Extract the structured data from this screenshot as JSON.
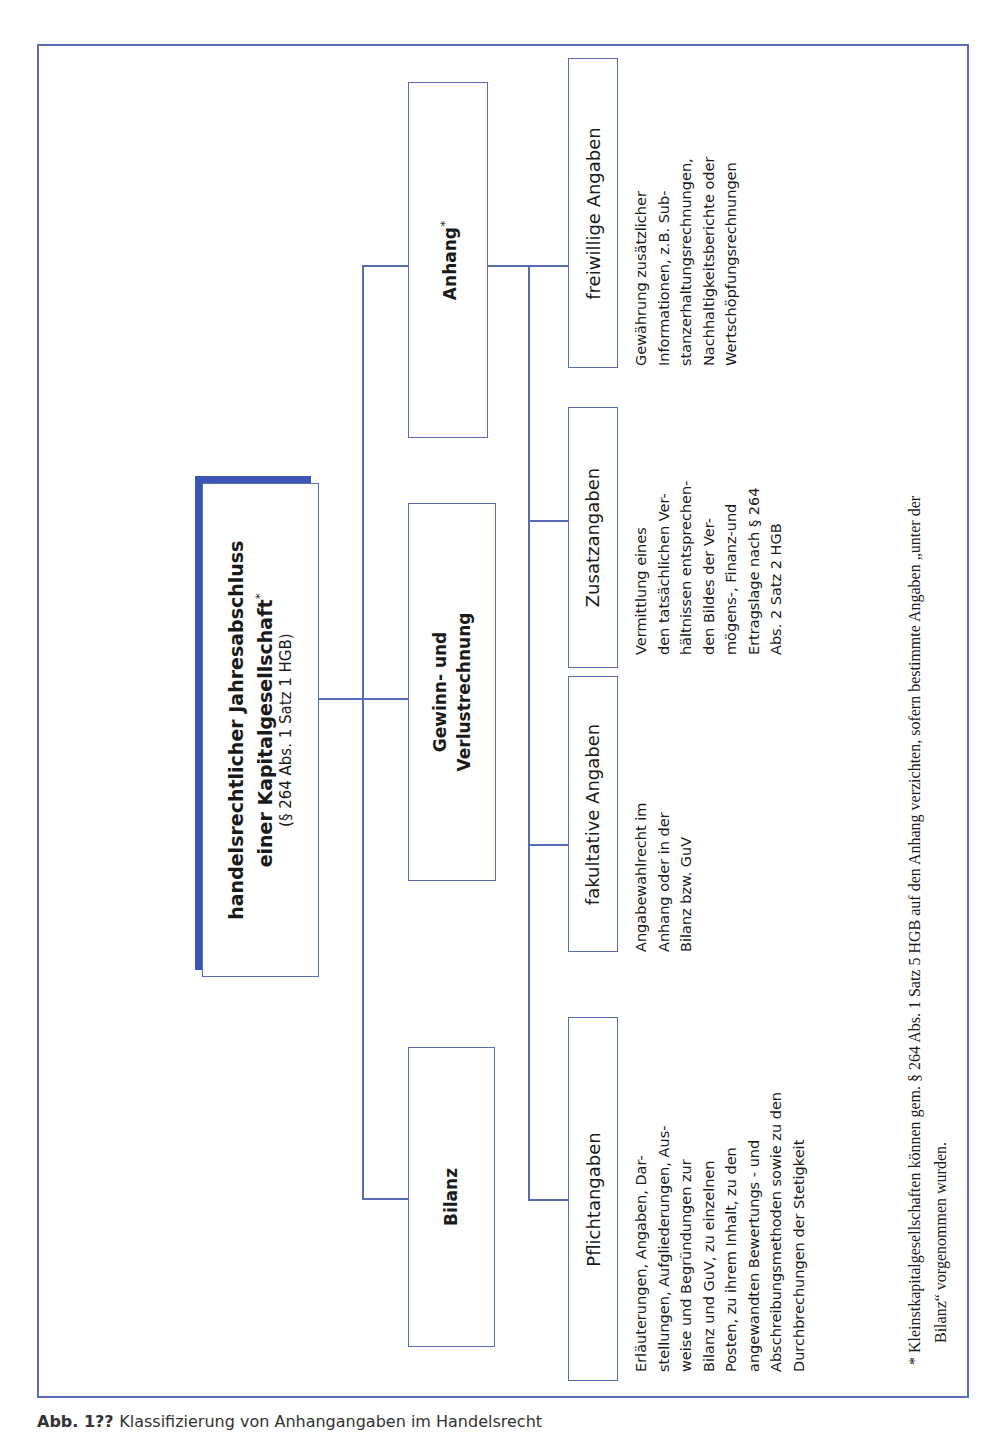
{
  "diagram": {
    "root": {
      "title_line1": "handelsrechtlicher Jahresabschluss",
      "title_line2": "einer Kapitalgesellschaft",
      "title_marker": "*",
      "subtitle": "(§ 264 Abs. 1 Satz 1 HGB)"
    },
    "level2": [
      {
        "label": "Bilanz"
      },
      {
        "label_line1": "Gewinn- und",
        "label_line2": "Verlustrechnung"
      },
      {
        "label": "Anhang",
        "marker": "*"
      }
    ],
    "level3": [
      {
        "label": "Pflichtangaben",
        "description": [
          "Erläuterungen, Angaben, Dar-",
          "stellungen, Aufgliederungen, Aus-",
          "weise und Begründungen zur",
          "Bilanz und GuV, zu einzelnen",
          "Posten, zu ihrem Inhalt, zu den",
          "angewandten Bewertungs - und",
          "Abschreibungsmethoden sowie zu den",
          "Durchbrechungen der Stetigkeit"
        ]
      },
      {
        "label": "fakultative Angaben",
        "description": [
          "Angabewahlrecht im",
          "Anhang oder in der",
          "Bilanz bzw. GuV"
        ]
      },
      {
        "label": "Zusatzangaben",
        "description": [
          "Vermittlung eines",
          "den tatsächlichen Ver-",
          "hältnissen entsprechen-",
          "den Bildes der Ver-",
          "mögens-, Finanz-und",
          "Ertragslage nach § 264",
          "Abs. 2 Satz 2 HGB"
        ]
      },
      {
        "label": "freiwillige Angaben",
        "description": [
          "Gewährung zusätzlicher",
          "Informationen, z.B. Sub-",
          "stanzerhaltungsrechnungen,",
          "Nachhaltigkeitsberichte oder",
          "Wertschöpfungsrechnungen"
        ]
      }
    ],
    "footnote": {
      "line1": "* Kleinstkapitalgesellschaften können gem. § 264 Abs. 1 Satz 5 HGB auf den Anhang verzichten, sofern bestimmte Angaben „unter der",
      "line2": "Bilanz“ vorgenommen wurden."
    },
    "colors": {
      "line": "#5a6bb5",
      "shadow": "#3a55b5",
      "text": "#1a1a1a"
    }
  },
  "caption": {
    "label": "Abb. 1??",
    "text": "Klassifizierung von Anhangangaben im Handelsrecht"
  }
}
